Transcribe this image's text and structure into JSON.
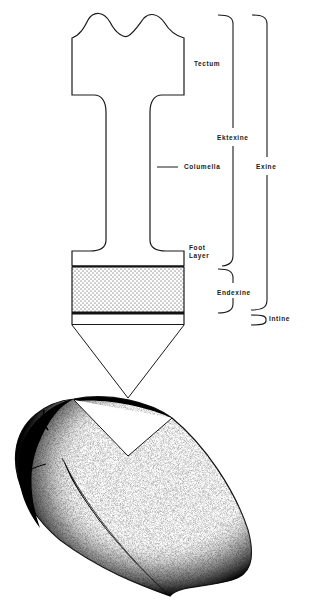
{
  "diagram": {
    "labels": {
      "tectum": "Tectum",
      "ektexine": "Ektexine",
      "columella": "Columella",
      "exine": "Exine",
      "foot_layer_line1": "Foot",
      "foot_layer_line2": "Layer",
      "endexine": "Endexine",
      "intine": "Intine"
    },
    "colors": {
      "ink": "#1a1a1a",
      "background": "#ffffff"
    }
  }
}
